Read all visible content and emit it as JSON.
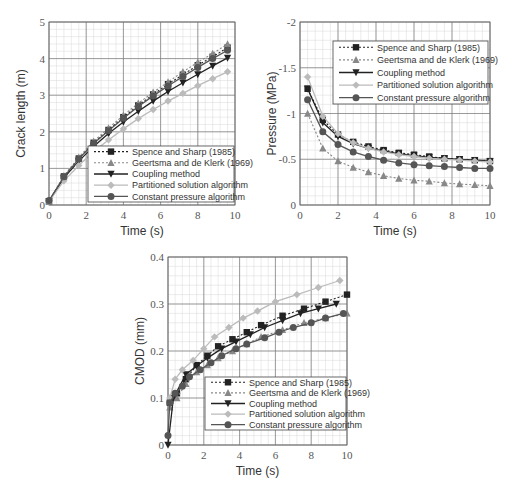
{
  "chart_data": [
    {
      "type": "line",
      "id": "crack-length",
      "title": "",
      "xlabel": "Time (s)",
      "ylabel": "Crack length (m)",
      "xlim": [
        0,
        10
      ],
      "ylim": [
        0,
        5
      ],
      "xticks": [
        "0",
        "2",
        "4",
        "6",
        "8",
        "10"
      ],
      "yticks": [
        "0",
        "1",
        "2",
        "3",
        "4",
        "5"
      ],
      "grid": true,
      "legend_position": "bottom-right",
      "x": [
        0.0,
        0.8,
        1.6,
        2.4,
        3.2,
        4.0,
        4.8,
        5.6,
        6.4,
        7.2,
        8.0,
        8.8,
        9.6
      ],
      "series": [
        {
          "name": "Spence and Sharp (1985)",
          "style": "dotted",
          "marker": "square",
          "color": "#222222",
          "values": [
            0.1,
            0.78,
            1.27,
            1.7,
            2.05,
            2.4,
            2.72,
            3.02,
            3.3,
            3.56,
            3.82,
            4.05,
            4.3
          ]
        },
        {
          "name": "Geertsma and de Klerk (1969)",
          "style": "dotted",
          "marker": "triangle-up",
          "color": "#888888",
          "values": [
            0.1,
            0.8,
            1.3,
            1.74,
            2.1,
            2.45,
            2.78,
            3.08,
            3.36,
            3.64,
            3.9,
            4.14,
            4.4
          ]
        },
        {
          "name": "Coupling method",
          "style": "solid",
          "marker": "triangle-down",
          "color": "#222222",
          "values": [
            0.1,
            0.74,
            1.2,
            1.6,
            1.95,
            2.27,
            2.56,
            2.84,
            3.1,
            3.34,
            3.57,
            3.8,
            4.02
          ]
        },
        {
          "name": "Partitioned solution algorithm",
          "style": "solid",
          "marker": "diamond",
          "color": "#bbbbbb",
          "values": [
            0.1,
            0.66,
            1.08,
            1.46,
            1.78,
            2.08,
            2.36,
            2.61,
            2.84,
            3.05,
            3.26,
            3.45,
            3.64
          ]
        },
        {
          "name": "Constant pressure algorithm",
          "style": "solid",
          "marker": "circle",
          "color": "#555555",
          "values": [
            0.12,
            0.77,
            1.26,
            1.68,
            2.03,
            2.37,
            2.69,
            2.98,
            3.25,
            3.51,
            3.76,
            4.0,
            4.23
          ]
        }
      ]
    },
    {
      "type": "line",
      "id": "pressure",
      "title": "",
      "xlabel": "Time (s)",
      "ylabel": "Pressure (MPa)",
      "xlim": [
        0,
        10
      ],
      "ylim": [
        0,
        -2
      ],
      "xticks": [
        "0",
        "2",
        "4",
        "6",
        "8",
        "10"
      ],
      "yticks": [
        "0",
        "-0.5",
        "-1",
        "-1.5",
        "-2"
      ],
      "grid": true,
      "legend_position": "top-right",
      "x": [
        0.4,
        1.2,
        2.0,
        2.8,
        3.6,
        4.4,
        5.2,
        6.0,
        6.8,
        7.6,
        8.4,
        9.2,
        10.0
      ],
      "series": [
        {
          "name": "Spence and Sharp (1985)",
          "style": "dotted",
          "marker": "square",
          "color": "#222222",
          "values": [
            -1.27,
            -0.93,
            -0.77,
            -0.69,
            -0.64,
            -0.6,
            -0.57,
            -0.55,
            -0.53,
            -0.51,
            -0.5,
            -0.49,
            -0.48
          ]
        },
        {
          "name": "Geertsma and de Klerk (1969)",
          "style": "dotted",
          "marker": "triangle-up",
          "color": "#888888",
          "values": [
            -1.0,
            -0.62,
            -0.48,
            -0.41,
            -0.36,
            -0.32,
            -0.29,
            -0.27,
            -0.26,
            -0.24,
            -0.23,
            -0.22,
            -0.21
          ]
        },
        {
          "name": "Coupling method",
          "style": "solid",
          "marker": "triangle-down",
          "color": "#222222",
          "values": [
            -1.27,
            -0.9,
            -0.75,
            -0.67,
            -0.62,
            -0.59,
            -0.56,
            -0.54,
            -0.52,
            -0.51,
            -0.5,
            -0.49,
            -0.48
          ]
        },
        {
          "name": "Partitioned solution algorithm",
          "style": "solid",
          "marker": "diamond",
          "color": "#bbbbbb",
          "values": [
            -1.4,
            -0.97,
            -0.78,
            -0.68,
            -0.62,
            -0.58,
            -0.55,
            -0.53,
            -0.51,
            -0.5,
            -0.49,
            -0.48,
            -0.47
          ]
        },
        {
          "name": "Constant pressure algorithm",
          "style": "solid",
          "marker": "circle",
          "color": "#555555",
          "values": [
            -1.15,
            -0.8,
            -0.66,
            -0.58,
            -0.53,
            -0.49,
            -0.46,
            -0.44,
            -0.43,
            -0.42,
            -0.41,
            -0.4,
            -0.4
          ]
        }
      ]
    },
    {
      "type": "line",
      "id": "cmod",
      "title": "",
      "xlabel": "Time (s)",
      "ylabel": "CMOD (mm)",
      "xlim": [
        0,
        10
      ],
      "ylim": [
        0,
        0.4
      ],
      "xticks": [
        "0",
        "2",
        "4",
        "6",
        "8",
        "10"
      ],
      "yticks": [
        "0",
        "0.1",
        "0.2",
        "0.3",
        "0.4"
      ],
      "grid": true,
      "legend_position": "bottom-right",
      "series": [
        {
          "name": "Spence and Sharp (1985)",
          "style": "dotted",
          "marker": "square",
          "color": "#222222",
          "x": [
            0.1,
            0.5,
            1.0,
            1.6,
            2.2,
            2.8,
            3.6,
            4.4,
            5.2,
            6.4,
            7.6,
            8.8,
            10.0
          ],
          "values": [
            0.09,
            0.11,
            0.14,
            0.17,
            0.19,
            0.21,
            0.225,
            0.24,
            0.255,
            0.275,
            0.29,
            0.305,
            0.32
          ]
        },
        {
          "name": "Geertsma and de Klerk (1969)",
          "style": "dotted",
          "marker": "triangle-up",
          "color": "#888888",
          "x": [
            0.1,
            0.5,
            1.0,
            1.6,
            2.2,
            2.8,
            3.6,
            4.4,
            5.2,
            6.4,
            7.6,
            8.8,
            10.0
          ],
          "values": [
            0.08,
            0.1,
            0.13,
            0.155,
            0.17,
            0.185,
            0.2,
            0.215,
            0.23,
            0.245,
            0.26,
            0.27,
            0.28
          ]
        },
        {
          "name": "Coupling method",
          "style": "solid",
          "marker": "triangle-down",
          "color": "#222222",
          "x": [
            0.0,
            0.3,
            1.0,
            1.6,
            2.2,
            3.0,
            3.8,
            4.6,
            5.4,
            6.4,
            7.4,
            8.4,
            9.4
          ],
          "values": [
            0.0,
            0.1,
            0.15,
            0.168,
            0.185,
            0.205,
            0.22,
            0.235,
            0.25,
            0.265,
            0.28,
            0.29,
            0.3
          ]
        },
        {
          "name": "Partitioned solution algorithm",
          "style": "solid",
          "marker": "diamond",
          "color": "#bbbbbb",
          "x": [
            0.1,
            0.4,
            0.8,
            1.4,
            2.0,
            2.6,
            3.4,
            4.2,
            5.0,
            6.0,
            7.2,
            8.4,
            9.6
          ],
          "values": [
            0.1,
            0.14,
            0.16,
            0.18,
            0.205,
            0.23,
            0.25,
            0.27,
            0.285,
            0.305,
            0.32,
            0.335,
            0.35
          ]
        },
        {
          "name": "Constant pressure algorithm",
          "style": "solid",
          "marker": "circle",
          "color": "#555555",
          "x": [
            0.0,
            0.1,
            0.4,
            0.8,
            1.2,
            1.8,
            2.4,
            3.0,
            3.8,
            4.4,
            5.4,
            6.2,
            7.0,
            8.0,
            8.8,
            9.8
          ],
          "values": [
            0.02,
            0.09,
            0.11,
            0.125,
            0.145,
            0.16,
            0.175,
            0.19,
            0.205,
            0.215,
            0.228,
            0.24,
            0.25,
            0.26,
            0.27,
            0.28
          ]
        }
      ]
    }
  ]
}
